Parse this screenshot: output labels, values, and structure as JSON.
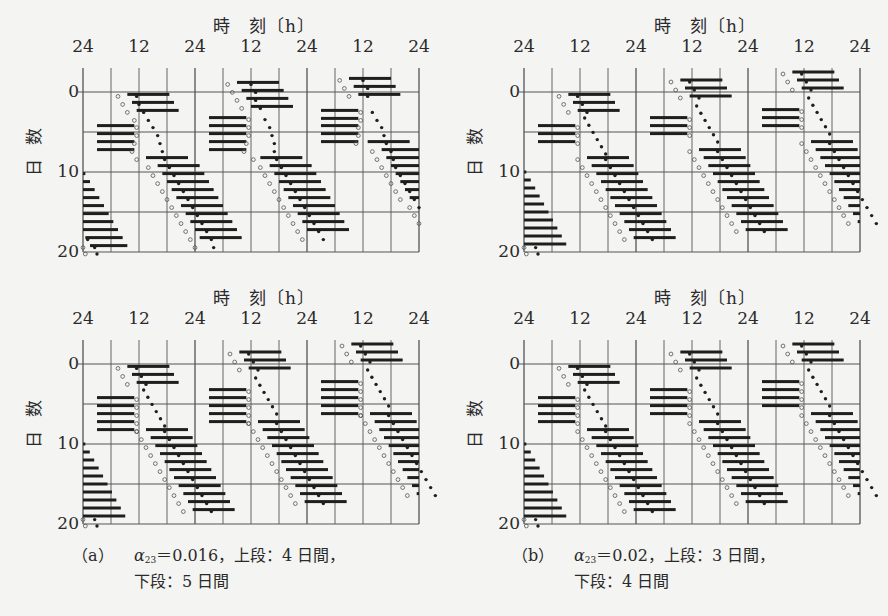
{
  "figure": {
    "x_axis_title": "時　刻〔h〕",
    "x_tick_labels": [
      "24",
      "12",
      "24",
      "12",
      "24",
      "12",
      "24"
    ],
    "y_axis_title": "日数",
    "y_tick_labels": [
      "0",
      "10",
      "20"
    ]
  },
  "captions": {
    "a": {
      "label": "（a）",
      "alpha_symbol": "α",
      "alpha_sub": "23",
      "text": "＝0.016，上段：4 日間，",
      "line2": "下段：5 日間"
    },
    "b": {
      "label": "（b）",
      "alpha_symbol": "α",
      "alpha_sub": "23",
      "text": "＝0.02，上段：3 日間，",
      "line2": "下段：4 日間"
    }
  },
  "chart_data": [
    {
      "type": "actogram",
      "id": "a-top",
      "title": "時刻〔h〕",
      "xlabel": "時刻〔h〕",
      "ylabel": "日数",
      "x_ticks": [
        "24",
        "12",
        "24",
        "12",
        "24",
        "12",
        "24"
      ],
      "x_range_hours": [
        0,
        72
      ],
      "y_range_days": [
        0,
        20
      ],
      "grid": "every 6h vertical, every 5 days horizontal",
      "condition": "α23=0.016, upper: 4 days",
      "rows": [
        {
          "day": -1.7,
          "bars": [
            [
              57,
              66
            ]
          ],
          "open": [
            55
          ],
          "filled": [
            60
          ]
        },
        {
          "day": -0.7,
          "bars": [
            [
              58,
              67
            ]
          ],
          "open": [
            56
          ],
          "filled": [
            61
          ]
        },
        {
          "day": -1.2,
          "bars": [
            [
              33,
              42
            ]
          ],
          "open": [
            31
          ],
          "filled": [
            36
          ]
        },
        {
          "day": -0.2,
          "bars": [
            [
              34,
              43
            ]
          ],
          "open": [
            32
          ],
          "filled": [
            37
          ]
        },
        {
          "day": 0.3,
          "bars": [
            [
              9.5,
              18.5
            ],
            [
              59,
              68
            ]
          ],
          "open": [
            7.5,
            57
          ],
          "filled": [
            11.5,
            61
          ]
        },
        {
          "day": 0.8,
          "bars": [
            [
              35,
              44
            ]
          ],
          "open": [
            33
          ],
          "filled": [
            37
          ]
        },
        {
          "day": 1.3,
          "bars": [
            [
              10.5,
              19.5
            ]
          ],
          "open": [
            8.5
          ],
          "filled": [
            12
          ]
        },
        {
          "day": 1.8,
          "bars": [
            [
              36,
              45
            ]
          ],
          "open": [
            34
          ],
          "filled": [
            38
          ]
        },
        {
          "day": 2.3,
          "bars": [
            [
              11.5,
              20.5
            ]
          ],
          "open": [
            9.5
          ],
          "filled": [
            13
          ]
        },
        {
          "day": 2.3,
          "bars": [
            [
              51,
              59
            ]
          ],
          "open": [
            59.5
          ],
          "filled": [
            62
          ]
        },
        {
          "day": 3.2,
          "bars": [
            [
              27,
              35
            ]
          ],
          "open": [
            35.5
          ],
          "filled": [
            39
          ]
        },
        {
          "day": 3.3,
          "bars": [
            [
              51,
              59
            ]
          ],
          "open": [
            59.5
          ],
          "filled": [
            63
          ]
        },
        {
          "day": 3.3,
          "bars": [],
          "open": [
            11
          ],
          "filled": [
            14
          ]
        },
        {
          "day": 4.2,
          "bars": [
            [
              3,
              11
            ],
            [
              27,
              35
            ],
            [
              51,
              59
            ]
          ],
          "open": [
            11.5,
            35.5,
            59
          ],
          "filled": [
            15,
            40,
            64
          ]
        },
        {
          "day": 5.2,
          "bars": [
            [
              3,
              11
            ],
            [
              27,
              35
            ],
            [
              51,
              59
            ]
          ],
          "open": [
            11.5,
            35.5,
            59
          ],
          "filled": [
            16,
            40.5,
            64.5
          ]
        },
        {
          "day": 6.2,
          "bars": [
            [
              3,
              11
            ],
            [
              27,
              35
            ],
            [
              51,
              59
            ]
          ],
          "open": [
            11,
            35,
            58.5
          ],
          "filled": [
            16.5,
            41,
            65
          ]
        },
        {
          "day": 6.2,
          "bars": [
            [
              61,
              70
            ]
          ],
          "open": [],
          "filled": []
        },
        {
          "day": 7.2,
          "bars": [
            [
              3,
              11
            ],
            [
              27,
              35
            ]
          ],
          "open": [
            10.5,
            34.5
          ],
          "filled": [
            17,
            41
          ]
        },
        {
          "day": 7.2,
          "bars": [
            [
              64,
              72
            ]
          ],
          "open": [
            62
          ],
          "filled": [
            66
          ]
        },
        {
          "day": 8.2,
          "bars": [
            [
              13.5,
              22.5
            ],
            [
              38,
              47
            ]
          ],
          "open": [
            11.5,
            36.5
          ],
          "filled": [
            17.5,
            41.5
          ]
        },
        {
          "day": 8.2,
          "bars": [
            [
              65,
              72
            ]
          ],
          "open": [
            63
          ],
          "filled": [
            66.5
          ]
        },
        {
          "day": 9.2,
          "bars": [
            [
              16,
              25
            ],
            [
              40,
              49
            ]
          ],
          "open": [
            14,
            38
          ],
          "filled": [
            18.5,
            42.5
          ]
        },
        {
          "day": 9.2,
          "bars": [
            [
              66,
              72
            ]
          ],
          "open": [
            64
          ],
          "filled": [
            67
          ]
        },
        {
          "day": 10.2,
          "bars": [
            [
              0,
              0.5
            ],
            [
              17,
              26
            ],
            [
              41,
              50
            ]
          ],
          "open": [
            15,
            39
          ],
          "filled": [
            19.5,
            43.5
          ]
        },
        {
          "day": 10.2,
          "bars": [
            [
              67,
              72
            ]
          ],
          "open": [
            65
          ],
          "filled": [
            68
          ]
        },
        {
          "day": 11.2,
          "bars": [
            [
              0,
              1.5
            ],
            [
              18,
              27
            ],
            [
              42,
              51
            ]
          ],
          "open": [
            16,
            40
          ],
          "filled": [
            20.5,
            44.5
          ]
        },
        {
          "day": 11.2,
          "bars": [
            [
              68,
              72
            ]
          ],
          "open": [
            66
          ],
          "filled": [
            69
          ]
        },
        {
          "day": 12.2,
          "bars": [
            [
              0,
              2.5
            ],
            [
              19,
              28
            ],
            [
              43,
              52
            ]
          ],
          "open": [
            17,
            41
          ],
          "filled": [
            21.5,
            45.5
          ]
        },
        {
          "day": 12.2,
          "bars": [
            [
              69,
              72
            ]
          ],
          "open": [
            67
          ],
          "filled": [
            70
          ]
        },
        {
          "day": 13.2,
          "bars": [
            [
              0,
              3.5
            ],
            [
              20,
              29
            ],
            [
              44,
              53
            ]
          ],
          "open": [
            18,
            42
          ],
          "filled": [
            22.5,
            46.5
          ]
        },
        {
          "day": 13.2,
          "bars": [
            [
              70,
              72
            ]
          ],
          "open": [
            68
          ],
          "filled": [
            71
          ]
        },
        {
          "day": 14.2,
          "bars": [
            [
              0,
              4.5
            ],
            [
              21,
              30
            ],
            [
              45,
              54
            ]
          ],
          "open": [
            19,
            43
          ],
          "filled": [
            23.5,
            47.5
          ]
        },
        {
          "day": 14.2,
          "bars": [],
          "open": [
            70
          ],
          "filled": [
            72
          ]
        },
        {
          "day": 15.2,
          "bars": [
            [
              0,
              5.5
            ],
            [
              22,
              31
            ],
            [
              46,
              55
            ]
          ],
          "open": [
            20,
            44,
            71
          ],
          "filled": [
            24.5,
            48.5
          ]
        },
        {
          "day": 16.2,
          "bars": [
            [
              0,
              6.5
            ],
            [
              23,
              32
            ],
            [
              47,
              56
            ]
          ],
          "open": [
            21,
            45,
            72
          ],
          "filled": [
            25.5,
            49.5
          ]
        },
        {
          "day": 17.2,
          "bars": [
            [
              0,
              7.5
            ],
            [
              24,
              33
            ],
            [
              48,
              57
            ]
          ],
          "open": [
            22,
            46
          ],
          "filled": [
            26.5,
            50.5
          ]
        },
        {
          "day": 18.2,
          "bars": [
            [
              0.5,
              8.5
            ],
            [
              25,
              34
            ]
          ],
          "open": [
            23,
            47
          ],
          "filled": [
            1,
            27.5,
            51.5
          ]
        },
        {
          "day": 19.2,
          "bars": [
            [
              1.5,
              9.5
            ]
          ],
          "open": [
            0,
            24
          ],
          "filled": [
            2.5,
            28
          ]
        },
        {
          "day": 20.0,
          "bars": [],
          "open": [
            0.5
          ],
          "filled": [
            3
          ]
        }
      ]
    },
    {
      "type": "actogram",
      "id": "a-bottom",
      "xlabel": "時刻〔h〕",
      "ylabel": "日数",
      "x_ticks": [
        "24",
        "12",
        "24",
        "12",
        "24",
        "12",
        "24"
      ],
      "x_range_hours": [
        0,
        72
      ],
      "y_range_days": [
        0,
        20
      ],
      "condition": "α23=0.016, lower: 5 days"
    },
    {
      "type": "actogram",
      "id": "b-top",
      "xlabel": "時刻〔h〕",
      "ylabel": "日数",
      "x_ticks": [
        "24",
        "12",
        "24",
        "12",
        "24",
        "12",
        "24"
      ],
      "x_range_hours": [
        0,
        72
      ],
      "y_range_days": [
        0,
        20
      ],
      "condition": "α23=0.02, upper: 3 days"
    },
    {
      "type": "actogram",
      "id": "b-bottom",
      "xlabel": "時刻〔h〕",
      "ylabel": "日数",
      "x_ticks": [
        "24",
        "12",
        "24",
        "12",
        "24",
        "12",
        "24"
      ],
      "x_range_hours": [
        0,
        72
      ],
      "y_range_days": [
        0,
        20
      ],
      "condition": "α23=0.02, lower: 4 days"
    }
  ],
  "panels": [
    {
      "id": "a-top",
      "x": 83,
      "y": 92,
      "restDays": 4,
      "baseShift": 0,
      "jump": 0
    },
    {
      "id": "b-top",
      "x": 524,
      "y": 92,
      "restDays": 3,
      "baseShift": 0,
      "jump": 0
    },
    {
      "id": "a-bottom",
      "x": 83,
      "y": 364,
      "restDays": 5,
      "baseShift": 0,
      "jump": 0
    },
    {
      "id": "b-bottom",
      "x": 524,
      "y": 364,
      "restDays": 4,
      "baseShift": 0,
      "jump": 0
    }
  ]
}
